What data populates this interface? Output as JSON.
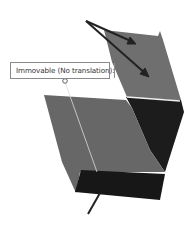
{
  "annotation": {
    "label": "Immovable (No translation):",
    "value": ""
  },
  "colors": {
    "top_face": "#6e6e6e",
    "front_face": "#666666",
    "right_face": "#1e1e1e",
    "bottom_face": "#181818",
    "edge_highlight": "#ededed",
    "arrow": "#222222",
    "leader_line": "#d8d8d8",
    "label_border": "#8a8a8a"
  },
  "symbols": {
    "fixture_arrows": "fixture-arrows-icon",
    "anchor": "anchor-circle-icon"
  }
}
